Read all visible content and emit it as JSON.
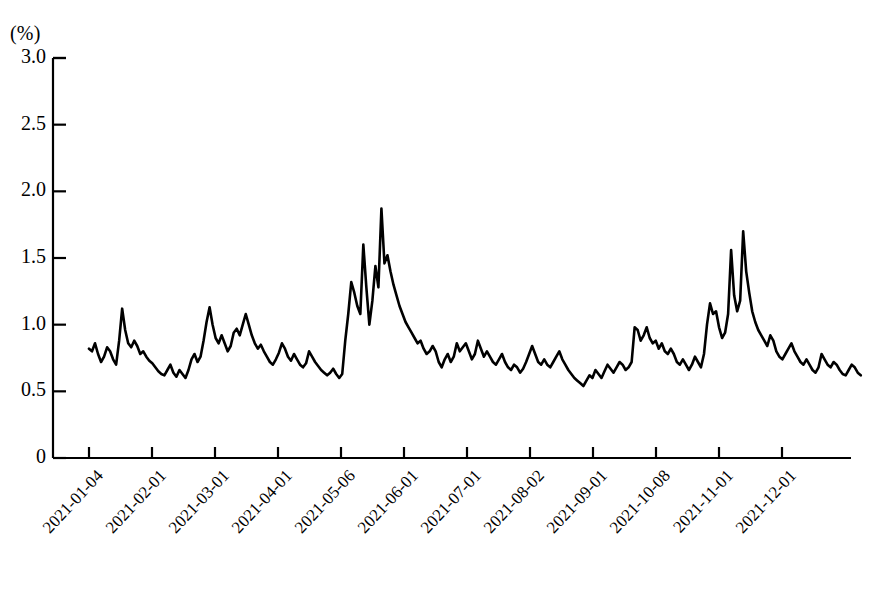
{
  "chart_data": {
    "type": "line",
    "title": "",
    "subtitle": "",
    "xlabel": "",
    "ylabel": "(%)",
    "unit_label": "(%)",
    "caption": "",
    "grid": false,
    "legend": null,
    "legend_position": "none",
    "line_color": "#000000",
    "background_color": "#ffffff",
    "axis_color": "#000000",
    "ylim": [
      0,
      3.0
    ],
    "ytick_labels": [
      "0",
      "0.5",
      "1.0",
      "1.5",
      "2.0",
      "2.5",
      "3.0"
    ],
    "ytick_values": [
      0,
      0.5,
      1.0,
      1.5,
      2.0,
      2.5,
      3.0
    ],
    "xtick_labels": [
      "2021-01-04",
      "2021-02-01",
      "2021-03-01",
      "2021-04-01",
      "2021-05-06",
      "2021-06-01",
      "2021-07-01",
      "2021-08-02",
      "2021-09-01",
      "2021-10-08",
      "2021-11-01",
      "2021-12-01"
    ],
    "xtick_indices": [
      0,
      20,
      40,
      60,
      80,
      100,
      120,
      140,
      160,
      180,
      200,
      220
    ],
    "x_index_range": [
      0,
      245
    ],
    "series": [
      {
        "name": "",
        "values": [
          0.82,
          0.8,
          0.86,
          0.78,
          0.72,
          0.76,
          0.83,
          0.8,
          0.74,
          0.7,
          0.88,
          1.12,
          0.96,
          0.86,
          0.83,
          0.88,
          0.84,
          0.78,
          0.8,
          0.76,
          0.73,
          0.71,
          0.68,
          0.65,
          0.63,
          0.62,
          0.66,
          0.7,
          0.64,
          0.61,
          0.66,
          0.63,
          0.6,
          0.66,
          0.74,
          0.78,
          0.72,
          0.76,
          0.88,
          1.02,
          1.13,
          1.0,
          0.9,
          0.86,
          0.92,
          0.86,
          0.8,
          0.84,
          0.94,
          0.97,
          0.92,
          1.0,
          1.08,
          1.0,
          0.92,
          0.86,
          0.82,
          0.85,
          0.8,
          0.76,
          0.72,
          0.7,
          0.74,
          0.79,
          0.86,
          0.82,
          0.76,
          0.73,
          0.78,
          0.74,
          0.7,
          0.68,
          0.71,
          0.8,
          0.76,
          0.72,
          0.69,
          0.66,
          0.64,
          0.62,
          0.64,
          0.67,
          0.63,
          0.6,
          0.63,
          0.88,
          1.08,
          1.32,
          1.24,
          1.14,
          1.08,
          1.6,
          1.28,
          1.0,
          1.18,
          1.44,
          1.28,
          1.87,
          1.46,
          1.52,
          1.4,
          1.3,
          1.22,
          1.14,
          1.08,
          1.02,
          0.98,
          0.94,
          0.9,
          0.86,
          0.88,
          0.82,
          0.78,
          0.8,
          0.84,
          0.8,
          0.72,
          0.68,
          0.74,
          0.78,
          0.72,
          0.76,
          0.86,
          0.8,
          0.83,
          0.86,
          0.8,
          0.74,
          0.78,
          0.88,
          0.82,
          0.76,
          0.8,
          0.76,
          0.72,
          0.7,
          0.74,
          0.78,
          0.72,
          0.68,
          0.66,
          0.7,
          0.68,
          0.64,
          0.67,
          0.72,
          0.78,
          0.84,
          0.78,
          0.72,
          0.7,
          0.74,
          0.7,
          0.68,
          0.72,
          0.76,
          0.8,
          0.74,
          0.7,
          0.66,
          0.63,
          0.6,
          0.58,
          0.56,
          0.54,
          0.58,
          0.62,
          0.6,
          0.66,
          0.63,
          0.6,
          0.65,
          0.7,
          0.67,
          0.64,
          0.68,
          0.72,
          0.7,
          0.66,
          0.68,
          0.72,
          0.98,
          0.96,
          0.88,
          0.92,
          0.98,
          0.9,
          0.86,
          0.88,
          0.82,
          0.86,
          0.8,
          0.78,
          0.82,
          0.78,
          0.72,
          0.7,
          0.74,
          0.7,
          0.66,
          0.7,
          0.76,
          0.72,
          0.68,
          0.78,
          1.0,
          1.16,
          1.08,
          1.1,
          0.98,
          0.9,
          0.94,
          1.08,
          1.56,
          1.22,
          1.1,
          1.18,
          1.7,
          1.4,
          1.24,
          1.1,
          1.02,
          0.96,
          0.92,
          0.88,
          0.84,
          0.92,
          0.88,
          0.8,
          0.76,
          0.74,
          0.78,
          0.82,
          0.86,
          0.8,
          0.76,
          0.72,
          0.7,
          0.74,
          0.7,
          0.66,
          0.64,
          0.68,
          0.78,
          0.74,
          0.7,
          0.68,
          0.72,
          0.7,
          0.66,
          0.63,
          0.62,
          0.66,
          0.7,
          0.68,
          0.64,
          0.62
        ]
      }
    ]
  }
}
